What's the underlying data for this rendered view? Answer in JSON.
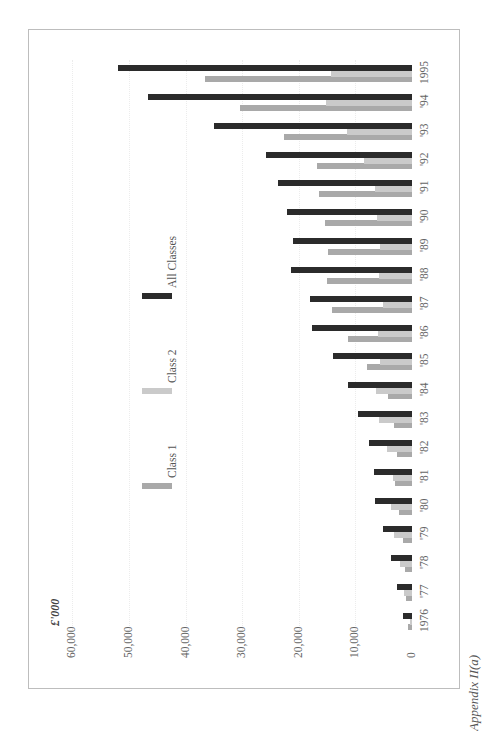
{
  "chart_data": {
    "type": "bar",
    "orientation": "rotated 90deg counter-clockwise (vertical bars rendered sideways)",
    "title": "",
    "caption": "Appendix II(a)",
    "ylabel": "£'000",
    "xlabel": "",
    "ylim": [
      0,
      60000
    ],
    "y_ticks": [
      "0",
      "10,000",
      "20,000",
      "30,000",
      "40,000",
      "50,000",
      "60,000"
    ],
    "grid": true,
    "legend_position": "inside, upper area",
    "categories": [
      "1976",
      "'77",
      "'78",
      "'79",
      "'80",
      "'81",
      "'82",
      "'83",
      "'84",
      "'85",
      "'86",
      "'87",
      "'88",
      "'89",
      "'90",
      "'91",
      "'92",
      "'93",
      "'94",
      "1995"
    ],
    "series": [
      {
        "name": "Class 1",
        "color": "#a9a9a9",
        "values": [
          700,
          1100,
          1200,
          1600,
          2300,
          3000,
          2700,
          3200,
          4200,
          8000,
          11300,
          14200,
          15000,
          14900,
          15400,
          16500,
          16800,
          22700,
          30400,
          36500
        ]
      },
      {
        "name": "Class 2",
        "color": "#cacaca",
        "values": [
          300,
          1400,
          2100,
          3200,
          3700,
          3400,
          4400,
          5800,
          6400,
          5700,
          6000,
          5100,
          5800,
          5700,
          6200,
          6500,
          8500,
          11500,
          15200,
          14300
        ]
      },
      {
        "name": "All Classes",
        "color": "#2b2b2b",
        "values": [
          1600,
          2700,
          3700,
          5100,
          6500,
          6700,
          7600,
          9600,
          11300,
          14000,
          17700,
          18100,
          21300,
          21000,
          22100,
          23700,
          25800,
          35000,
          46700,
          52000
        ]
      }
    ]
  },
  "axis": {
    "unit_label": "£'000",
    "ticks": [
      {
        "label": "60,000",
        "value": 60000
      },
      {
        "label": "50,000",
        "value": 50000
      },
      {
        "label": "40,000",
        "value": 40000
      },
      {
        "label": "30,000",
        "value": 30000
      },
      {
        "label": "20,000",
        "value": 20000
      },
      {
        "label": "10,000",
        "value": 10000
      },
      {
        "label": "0",
        "value": 0
      }
    ]
  },
  "legend": {
    "items": [
      {
        "label": "Class 1",
        "color": "#a9a9a9"
      },
      {
        "label": "Class 2",
        "color": "#cacaca"
      },
      {
        "label": "All Classes",
        "color": "#2b2b2b"
      }
    ]
  },
  "caption": "Appendix II(a)"
}
